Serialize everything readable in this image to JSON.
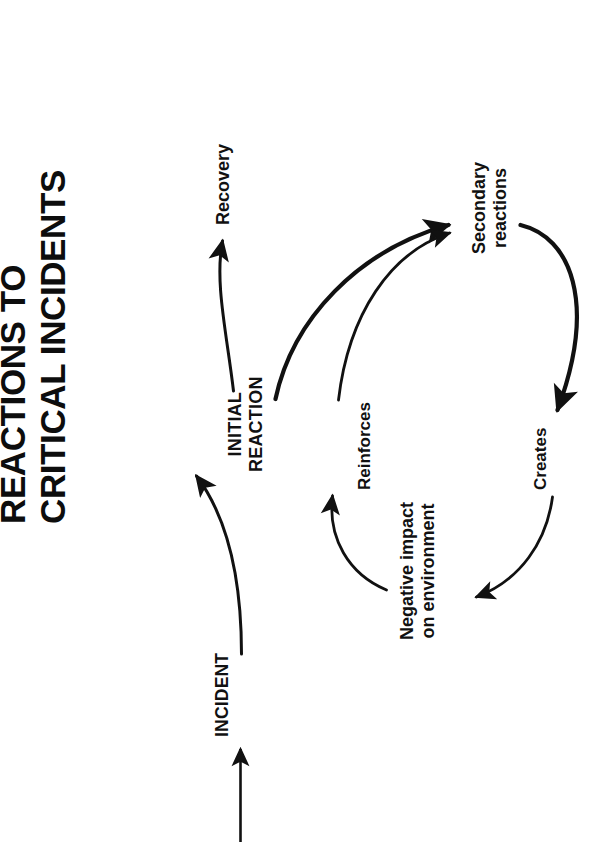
{
  "figure": {
    "title_lines": [
      "REACTIONS TO",
      "CRITICAL INCIDENTS"
    ],
    "orientation": "rotated-90-ccw",
    "ink_color": "#111111",
    "background_color": "#ffffff"
  },
  "nodes": {
    "incident": {
      "label": "INCIDENT"
    },
    "initial_reaction": {
      "line1": "INITIAL",
      "line2": "REACTION"
    },
    "recovery": {
      "label": "Recovery"
    },
    "secondary_reactions": {
      "line1": "Secondary",
      "line2": "reactions"
    },
    "negative_impact": {
      "line1": "Negative impact",
      "line2": "on environment"
    }
  },
  "edge_labels": {
    "reinforces": "Reinforces",
    "creates": "Creates"
  },
  "edges": [
    {
      "name": "timeline-to-incident",
      "from": "timeline",
      "to": "incident",
      "style": "straight-arrow"
    },
    {
      "name": "incident-to-initial-reaction",
      "from": "incident",
      "to": "initial_reaction",
      "style": "curved-arrow"
    },
    {
      "name": "initial-reaction-to-recovery",
      "from": "initial_reaction",
      "to": "recovery",
      "style": "curved-arrow"
    },
    {
      "name": "initial-reaction-to-secondary",
      "from": "initial_reaction",
      "to": "secondary_reactions",
      "style": "curved-arrow"
    },
    {
      "name": "secondary-to-creates",
      "from": "secondary_reactions",
      "to": "creates",
      "style": "curved-arrow"
    },
    {
      "name": "creates-to-negative-impact",
      "from": "creates",
      "to": "negative_impact",
      "style": "curved-arrow"
    },
    {
      "name": "negative-impact-to-reinforces",
      "from": "negative_impact",
      "to": "reinforces",
      "style": "curved-arrow"
    },
    {
      "name": "reinforces-to-secondary",
      "from": "reinforces",
      "to": "secondary_reactions",
      "style": "curved-arrow"
    }
  ]
}
